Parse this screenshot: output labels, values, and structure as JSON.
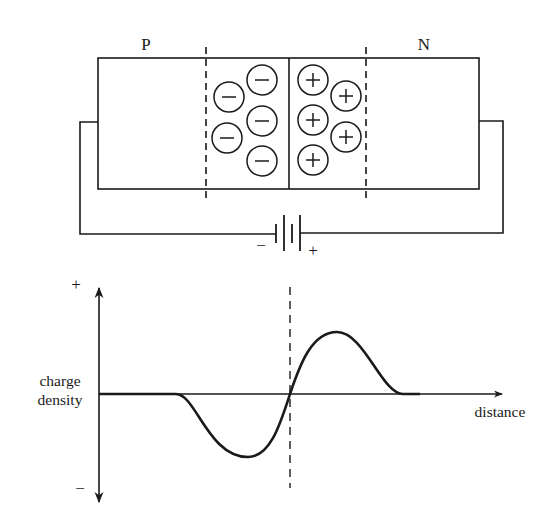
{
  "diagram": {
    "colors": {
      "ink": "#1a1a1a",
      "background": "#ffffff"
    },
    "junction": {
      "p_label": "P",
      "n_label": "N",
      "negative_ion_symbol": "−",
      "positive_ion_symbol": "+",
      "negative_ions": [
        {
          "cx": 229,
          "cy": 97
        },
        {
          "cx": 262,
          "cy": 80
        },
        {
          "cx": 262,
          "cy": 121
        },
        {
          "cx": 227,
          "cy": 138
        },
        {
          "cx": 262,
          "cy": 161
        }
      ],
      "positive_ions": [
        {
          "cx": 313,
          "cy": 80
        },
        {
          "cx": 346,
          "cy": 96
        },
        {
          "cx": 313,
          "cy": 120
        },
        {
          "cx": 346,
          "cy": 137
        },
        {
          "cx": 313,
          "cy": 160
        }
      ]
    },
    "battery": {
      "negative_label": "−",
      "positive_label": "+"
    },
    "graph": {
      "y_axis_label_line1": "charge",
      "y_axis_label_line2": "density",
      "y_plus_label": "+",
      "y_minus_label": "−",
      "x_axis_label": "distance"
    }
  }
}
